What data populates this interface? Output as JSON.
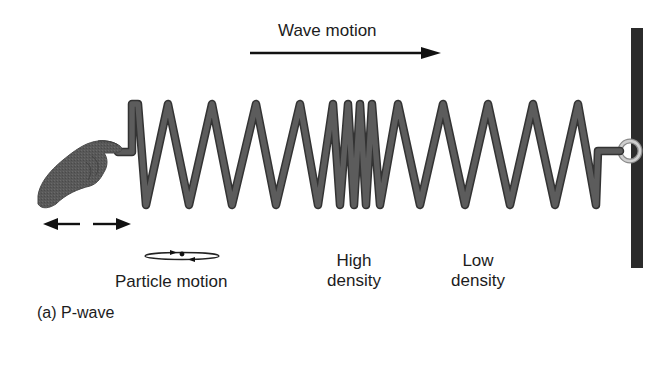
{
  "figure": {
    "caption": "(a) P-wave",
    "labels": {
      "wave_motion": "Wave motion",
      "particle_motion": "Particle motion",
      "high_density": [
        "High",
        "density"
      ],
      "low_density": [
        "Low",
        "density"
      ]
    },
    "elements": {
      "spring": {
        "color": "#555555",
        "peak_y": 104,
        "trough_y": 205,
        "peaks_x": [
          138,
          168,
          212,
          256,
          300,
          333,
          348,
          360,
          372,
          398,
          443,
          488,
          533,
          578
        ],
        "troughs_x": [
          146,
          189,
          232,
          276,
          318,
          340,
          354,
          366,
          380,
          420,
          465,
          510,
          555,
          596
        ],
        "compression_region": "High density",
        "rarefaction_region": "Low density"
      },
      "wall": {
        "color": "#2a2a2a"
      },
      "hand": {
        "color": "#5a5a5a"
      },
      "arrows": {
        "wave_direction": "right",
        "hand_motion": "left-right"
      }
    }
  }
}
